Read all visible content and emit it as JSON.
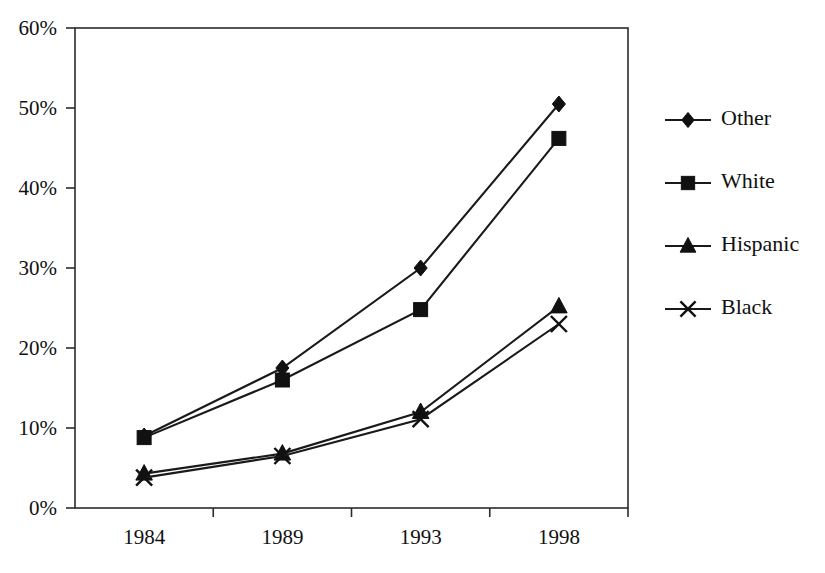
{
  "chart_data": {
    "type": "line",
    "title": "",
    "subtitle": "",
    "xlabel": "",
    "ylabel": "",
    "categories": [
      "1984",
      "1989",
      "1993",
      "1998"
    ],
    "ylim": [
      0,
      60
    ],
    "ytick_values": [
      0,
      10,
      20,
      30,
      40,
      50,
      60
    ],
    "ytick_labels": [
      "0%",
      "10%",
      "20%",
      "30%",
      "40%",
      "50%",
      "60%"
    ],
    "grid": false,
    "legend_position": "right",
    "value_suffix": "%",
    "series": [
      {
        "name": "Other",
        "marker": "diamond",
        "values": [
          9.0,
          17.5,
          30.0,
          50.5
        ]
      },
      {
        "name": "White",
        "marker": "square",
        "values": [
          8.8,
          16.0,
          24.8,
          46.2
        ]
      },
      {
        "name": "Hispanic",
        "marker": "triangle",
        "values": [
          4.3,
          6.8,
          12.0,
          25.2
        ]
      },
      {
        "name": "Black",
        "marker": "cross-x",
        "values": [
          3.8,
          6.5,
          11.1,
          23.0
        ]
      }
    ]
  },
  "legend": {
    "entries": [
      {
        "label": "Other",
        "marker": "diamond"
      },
      {
        "label": "White",
        "marker": "square"
      },
      {
        "label": "Hispanic",
        "marker": "triangle"
      },
      {
        "label": "Black",
        "marker": "cross-x"
      }
    ]
  },
  "colors": {
    "line": "#1a1a1a",
    "marker": "#111111",
    "axis": "#2b2b2b",
    "background": "#ffffff"
  }
}
